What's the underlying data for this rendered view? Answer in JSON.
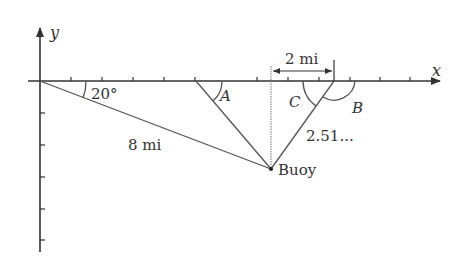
{
  "diagram": {
    "axes": {
      "x_label": "x",
      "y_label": "y"
    },
    "angles": {
      "angle_20": "20°",
      "angle_A": "A",
      "angle_B": "B",
      "angle_C": "C"
    },
    "distances": {
      "hypotenuse": "8 mi",
      "horizontal_gap": "2 mi",
      "short_side": "2.51..."
    },
    "points": {
      "buoy": "Buoy"
    },
    "colors": {
      "line": "#555555",
      "axis": "#333333",
      "text": "#333333",
      "background": "#ffffff"
    }
  }
}
